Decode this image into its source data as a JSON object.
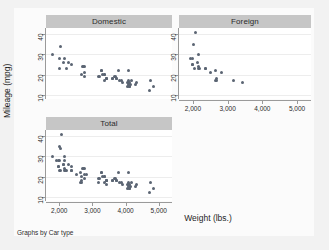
{
  "note": "Graphs by Car type",
  "axis_titles": {
    "x": "Weight (lbs.)",
    "y": "Mileage (mpg)"
  },
  "panels": [
    {
      "key": "domestic",
      "title": "Domestic"
    },
    {
      "key": "foreign",
      "title": "Foreign"
    },
    {
      "key": "total",
      "title": "Total"
    }
  ],
  "ticks": {
    "x_labels": [
      "2,000",
      "3,000",
      "4,000",
      "5,000"
    ],
    "x_values": [
      2000,
      3000,
      4000,
      5000
    ],
    "y_labels": [
      "40",
      "30",
      "20",
      "10"
    ],
    "y_values": [
      40,
      30,
      20,
      10
    ]
  },
  "colors": {
    "marker": "#5b6573",
    "panel_title_bg": "#c6c6c6",
    "plot_bg": "#ffffff",
    "graph_region_bg": "#fbfbfb",
    "outer_bg": "#f2f2f2",
    "gridline": "#ededed",
    "axis": "#9a9a9a"
  },
  "chart_data": {
    "type": "scatter",
    "title": "",
    "subtitle": "",
    "xlabel": "Weight (lbs.)",
    "ylabel": "Mileage (mpg)",
    "annotations": [
      "Graphs by Car type"
    ],
    "grid": true,
    "legend": "none",
    "faceted_by": "Car type",
    "xlim": [
      1600,
      5400
    ],
    "ylim": [
      8,
      43
    ],
    "xticks": [
      2000,
      3000,
      4000,
      5000
    ],
    "yticks": [
      10,
      20,
      30,
      40
    ],
    "panels": [
      {
        "name": "Domestic",
        "x": [
          4099,
          4749,
          3799,
          4172,
          2020,
          4141,
          3350,
          4080,
          3670,
          2230,
          3280,
          3880,
          4330,
          3900,
          4290,
          4082,
          3300,
          3690,
          3180,
          3220,
          4060,
          3600,
          3600,
          3740,
          4840,
          4720,
          3370,
          4130,
          3820,
          4060,
          4130,
          4080,
          3720,
          3370,
          4130,
          2690,
          2730,
          3280,
          2750,
          3430,
          2370,
          2020,
          2280,
          2750,
          3430,
          2120,
          2670,
          2160,
          2750,
          3420,
          2050,
          1800
        ],
        "y": [
          22,
          17,
          22,
          17,
          23,
          15,
          17,
          17,
          19,
          23,
          22,
          17,
          16,
          16,
          15,
          16,
          20,
          19,
          19,
          19,
          16,
          18,
          18,
          18,
          14,
          12,
          20,
          16,
          17,
          14,
          14,
          15,
          18,
          20,
          14,
          24,
          24,
          22,
          24,
          18,
          25,
          28,
          26,
          21,
          18,
          26,
          20,
          28,
          19,
          18,
          34,
          30
        ]
      },
      {
        "name": "Foreign",
        "x": [
          2640,
          2830,
          2070,
          2650,
          1990,
          2160,
          2670,
          2370,
          2370,
          2020,
          1980,
          2160,
          2040,
          1930,
          1990,
          3170,
          2160,
          2200,
          2670,
          3420,
          2520,
          2130
        ],
        "y": [
          22,
          21,
          41,
          17,
          25,
          24,
          17,
          23,
          23,
          35,
          25,
          30,
          23,
          28,
          28,
          17,
          23,
          23,
          18,
          16,
          21,
          26
        ]
      },
      {
        "name": "Total",
        "x": [
          4099,
          4749,
          3799,
          4172,
          2020,
          4141,
          3350,
          4080,
          3670,
          2230,
          3280,
          3880,
          4330,
          3900,
          4290,
          4082,
          3300,
          3690,
          3180,
          3220,
          4060,
          3600,
          3600,
          3740,
          4840,
          4720,
          3370,
          4130,
          3820,
          4060,
          4130,
          4080,
          3720,
          3370,
          4130,
          2690,
          2730,
          3280,
          2750,
          3430,
          2370,
          2020,
          2280,
          2750,
          3430,
          2120,
          2670,
          2160,
          2750,
          3420,
          2050,
          1800,
          2640,
          2830,
          2070,
          2650,
          1990,
          2160,
          2670,
          2370,
          2370,
          2020,
          1980,
          2160,
          2040,
          1930,
          1990,
          3170,
          2160,
          2200,
          2670,
          3420,
          2520,
          2130
        ],
        "y": [
          22,
          17,
          22,
          17,
          23,
          15,
          17,
          17,
          19,
          23,
          22,
          17,
          16,
          16,
          15,
          16,
          20,
          19,
          19,
          19,
          16,
          18,
          18,
          18,
          14,
          12,
          20,
          16,
          17,
          14,
          14,
          15,
          18,
          20,
          14,
          24,
          24,
          22,
          24,
          18,
          25,
          28,
          26,
          21,
          18,
          26,
          20,
          28,
          19,
          18,
          34,
          30,
          22,
          21,
          41,
          17,
          25,
          24,
          17,
          23,
          23,
          35,
          25,
          30,
          23,
          28,
          28,
          17,
          23,
          23,
          18,
          16,
          21,
          26
        ]
      }
    ]
  }
}
